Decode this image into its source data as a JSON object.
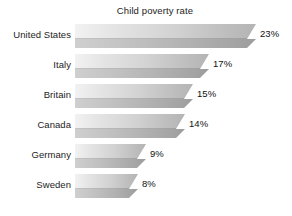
{
  "chart_data": {
    "type": "bar",
    "orientation": "horizontal",
    "title": "Child poverty rate",
    "subtitle": "",
    "xlabel": "",
    "ylabel": "",
    "categories": [
      "United States",
      "Italy",
      "Britain",
      "Canada",
      "Germany",
      "Sweden"
    ],
    "values": [
      23,
      17,
      15,
      14,
      9,
      8
    ],
    "value_labels": [
      "23%",
      "17%",
      "15%",
      "14%",
      "9%",
      "8%"
    ],
    "unit": "%",
    "xlim": [
      0,
      23
    ],
    "grid": false,
    "axis_visible": false,
    "legend": null,
    "legend_position": "none",
    "style": "3d-shaded-grayscale",
    "background_color": "#ffffff",
    "bar_color_light": "#f2f2f2",
    "bar_color_dark": "#9c9c9c",
    "text_color": "#1c1c1c"
  },
  "chart": {
    "title": "Child poverty rate",
    "rows": [
      {
        "label": "United States",
        "value": 23,
        "value_label": "23%"
      },
      {
        "label": "Italy",
        "value": 17,
        "value_label": "17%"
      },
      {
        "label": "Britain",
        "value": 15,
        "value_label": "15%"
      },
      {
        "label": "Canada",
        "value": 14,
        "value_label": "14%"
      },
      {
        "label": "Germany",
        "value": 9,
        "value_label": "9%"
      },
      {
        "label": "Sweden",
        "value": 8,
        "value_label": "8%"
      }
    ]
  }
}
